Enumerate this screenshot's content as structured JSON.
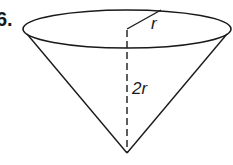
{
  "problem": {
    "number": "6."
  },
  "figure": {
    "shape": "inverted cone",
    "labels": {
      "radius": "r",
      "height": "2r"
    },
    "colors": {
      "stroke": "#1a1a1a",
      "background": "#ffffff"
    }
  }
}
